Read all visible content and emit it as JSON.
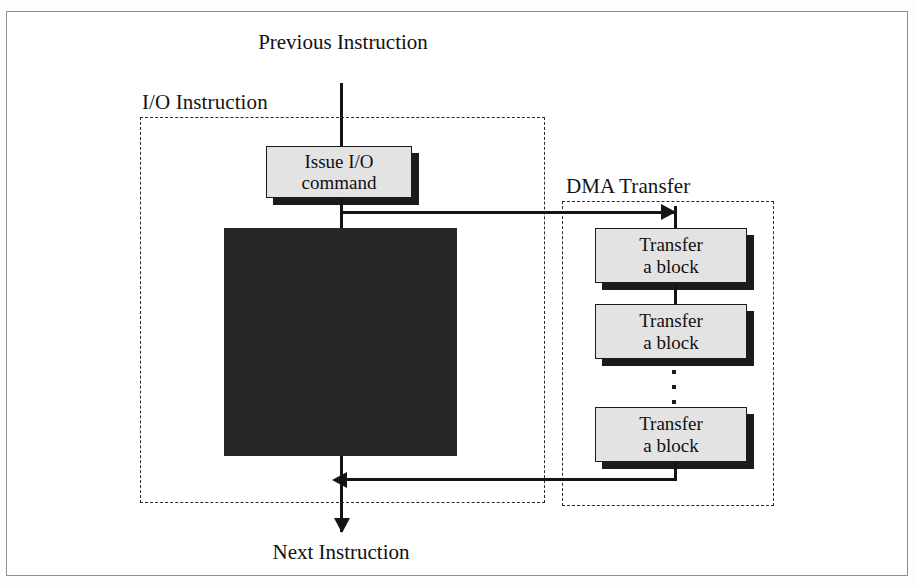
{
  "figure": {
    "endpoints": {
      "previous": "Previous Instruction",
      "next": "Next Instruction"
    },
    "groups": [
      {
        "key": "io",
        "label": "I/O Instruction"
      },
      {
        "key": "dma",
        "label": "DMA Transfer"
      }
    ],
    "boxes": {
      "issue_command": "Issue I/O\ncommand",
      "issue_command_line1": "Issue I/O",
      "issue_command_line2": "command",
      "transfer_line1": "Transfer",
      "transfer_line2": "a block"
    },
    "transfer_blocks": [
      {
        "line1": "Transfer",
        "line2": "a block"
      },
      {
        "line1": "Transfer",
        "line2": "a block"
      },
      {
        "line1": "Transfer",
        "line2": "a block"
      }
    ],
    "ellipsis": "⋮",
    "colors": {
      "box_fill": "#e3e3e3",
      "box_stroke": "#1b1b1b",
      "shadow": "#1b1b1b",
      "dark_region": "#272727",
      "line": "#141414",
      "dashed_group": "#2a2a2a",
      "frame": "#8d8d8d",
      "page": "#ffffff"
    }
  }
}
